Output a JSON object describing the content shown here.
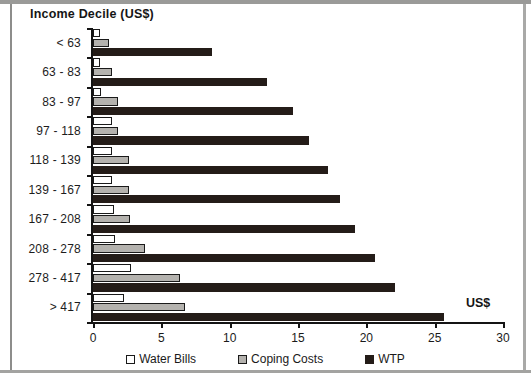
{
  "chart_data": {
    "type": "bar",
    "orientation": "horizontal",
    "title": "Income Decile (US$)",
    "xlabel": "US$",
    "ylabel": "Income Decile (US$)",
    "xlim": [
      0,
      30
    ],
    "xticks": [
      0,
      5,
      10,
      15,
      20,
      25,
      30
    ],
    "xtick_labels": [
      "0",
      "5",
      "10",
      "15",
      "20",
      "25",
      "30"
    ],
    "grid": false,
    "legend_position": "bottom",
    "categories": [
      "< 63",
      "63 - 83",
      "83 - 97",
      "97 - 118",
      "118 - 139",
      "139 - 167",
      "167 - 208",
      "208 - 278",
      "278 - 417",
      "> 417"
    ],
    "series": [
      {
        "name": "Water Bills",
        "color": "#ffffff",
        "values": [
          0.5,
          0.5,
          0.6,
          1.4,
          1.4,
          1.4,
          1.5,
          1.6,
          2.8,
          2.3
        ]
      },
      {
        "name": "Coping Costs",
        "color": "#b4b2ae",
        "values": [
          1.2,
          1.4,
          1.8,
          1.8,
          2.6,
          2.6,
          2.7,
          3.8,
          6.4,
          6.7
        ]
      },
      {
        "name": "WTP",
        "color": "#241c18",
        "values": [
          8.7,
          12.7,
          14.6,
          15.8,
          17.2,
          18.1,
          19.2,
          20.6,
          22.1,
          25.7
        ]
      }
    ]
  }
}
